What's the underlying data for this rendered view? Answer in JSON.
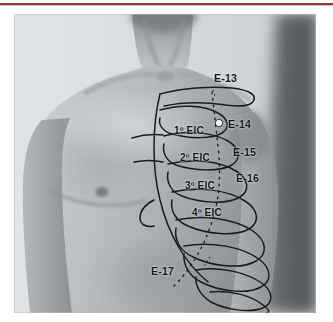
{
  "figure": {
    "kind": "anatomical-photograph",
    "overlay": "rib-cage-line-drawing",
    "colors": {
      "page_background": "#ffffff",
      "top_rule": "#8f3b34",
      "photo_base": "#c9cdd0",
      "skin_light": "#d9dcde",
      "skin_mid": "#a9aeb2",
      "skin_shadow": "#7f868b",
      "backdrop_dark": "#4a4f53",
      "ink": "#14171a",
      "point_marker": "#ffffff"
    }
  },
  "labels": {
    "points": [
      {
        "id": "e13",
        "text": "E-13",
        "x": 214,
        "y": 72
      },
      {
        "id": "e14",
        "text": "E-14",
        "x": 228,
        "y": 118
      },
      {
        "id": "e15",
        "text": "E-15",
        "x": 233,
        "y": 146
      },
      {
        "id": "e16",
        "text": "E-16",
        "x": 236,
        "y": 172
      },
      {
        "id": "e17",
        "text": "E-17",
        "x": 151,
        "y": 265
      }
    ],
    "spaces": [
      {
        "id": "eic1",
        "text": "1º EIC",
        "x": 174,
        "y": 125
      },
      {
        "id": "eic2",
        "text": "2º EIC",
        "x": 180,
        "y": 152
      },
      {
        "id": "eic3",
        "text": "3º EIC",
        "x": 185,
        "y": 180
      },
      {
        "id": "eic4",
        "text": "4º EIC",
        "x": 192,
        "y": 207
      }
    ]
  },
  "markers": {
    "e14_dot": {
      "x": 216,
      "y": 119
    }
  }
}
